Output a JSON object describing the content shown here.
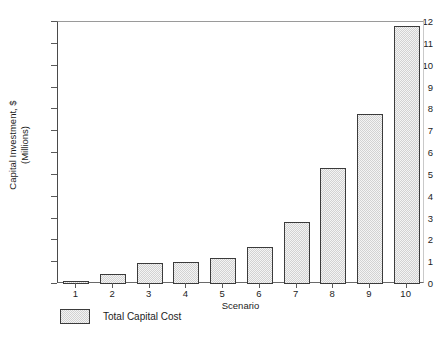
{
  "chart_data": {
    "type": "bar",
    "title": "",
    "xlabel": "Scenario",
    "ylabel": "Capital Investment, $ (Millions)",
    "ylabel_line1": "Capital Investment, $",
    "ylabel_line2": "(Millions)",
    "categories": [
      "1",
      "2",
      "3",
      "4",
      "5",
      "6",
      "7",
      "8",
      "9",
      "10"
    ],
    "values": [
      0.1,
      0.45,
      0.95,
      1.0,
      1.2,
      1.7,
      2.85,
      5.3,
      7.8,
      11.8
    ],
    "series": [
      {
        "name": "Total Capital Cost",
        "values": [
          0.1,
          0.45,
          0.95,
          1.0,
          1.2,
          1.7,
          2.85,
          5.3,
          7.8,
          11.8
        ]
      }
    ],
    "ylim": [
      0,
      12
    ],
    "yticks": [
      0,
      1,
      2,
      3,
      4,
      5,
      6,
      7,
      8,
      9,
      10,
      11,
      12
    ],
    "ytick_labels": [
      "0",
      "1",
      "2",
      "3",
      "4",
      "5",
      "6",
      "7",
      "8",
      "9",
      "10",
      "11",
      "12"
    ],
    "grid": false,
    "legend_position": "bottom-left",
    "legend": [
      {
        "label": "Total Capital Cost",
        "swatch": "hatched-light-gray"
      }
    ],
    "colors": {
      "bar_fill": "#e9e9e9",
      "bar_edge": "#3b3b3b",
      "axis": "#4a4a4a",
      "text": "#1c1c1c",
      "background": "#ffffff"
    }
  }
}
